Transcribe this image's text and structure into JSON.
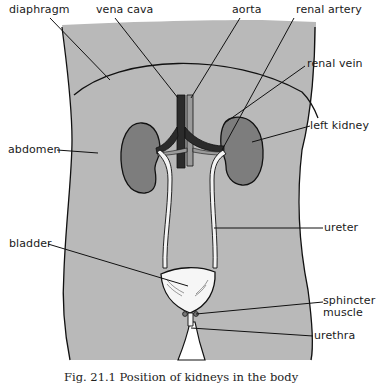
{
  "figure": {
    "caption": "Fig. 21.1  Position of kidneys in the body",
    "colors": {
      "body_fill": "#b9b9b9",
      "kidney_fill": "#7d7d7d",
      "vessel_dark": "#2b2b2b",
      "vessel_light": "#9a9a9a",
      "ureter_fill": "#f4f4f4",
      "outline": "#111111",
      "background": "#ffffff"
    },
    "labels": {
      "diaphragm": "diaphragm",
      "vena_cava": "vena cava",
      "aorta": "aorta",
      "renal_artery": "renal artery",
      "renal_vein": "renal vein",
      "abdomen": "abdomen",
      "left_kidney": "left kidney",
      "ureter": "ureter",
      "bladder": "bladder",
      "sphincter_muscle_line1": "sphincter",
      "sphincter_muscle_line2": "muscle",
      "urethra": "urethra"
    }
  }
}
